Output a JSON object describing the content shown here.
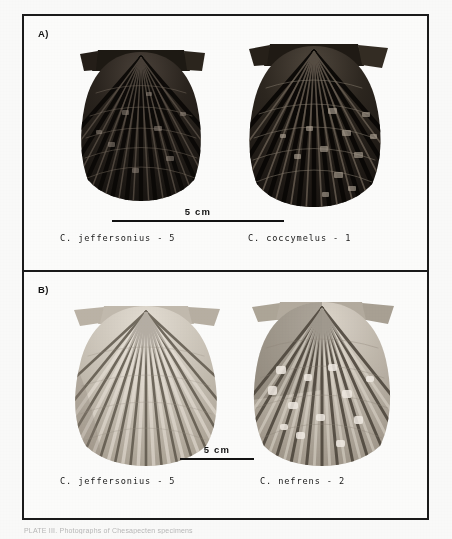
{
  "plate": {
    "caption": "PLATE III.  Photographs of Chesapecten specimens",
    "panels": [
      {
        "id": "A",
        "label": "A)",
        "scalebar": {
          "text": "5 cm",
          "length_cm": 5
        },
        "specimens": [
          {
            "label": "C. jeffersonius - 5",
            "genus_abbrev": "C.",
            "species": "jeffersonius",
            "number": "5",
            "tone": "dark"
          },
          {
            "label": "C. coccymelus - 1",
            "genus_abbrev": "C.",
            "species": "coccymelus",
            "number": "1",
            "tone": "dark"
          }
        ]
      },
      {
        "id": "B",
        "label": "B)",
        "scalebar": {
          "text": "5 cm",
          "length_cm": 5
        },
        "specimens": [
          {
            "label": "C. jeffersonius - 5",
            "genus_abbrev": "C.",
            "species": "jeffersonius",
            "number": "5",
            "tone": "light"
          },
          {
            "label": "C. nefrens - 2",
            "genus_abbrev": "C.",
            "species": "nefrens",
            "number": "2",
            "tone": "light"
          }
        ]
      }
    ]
  },
  "colors": {
    "frame": "#1a1a1a",
    "paper": "#fdfdfc",
    "ink": "#141414",
    "shell_dark": "#211d19",
    "shell_light": "#cfc8bd",
    "caption_faded": "#b9b9b9"
  }
}
